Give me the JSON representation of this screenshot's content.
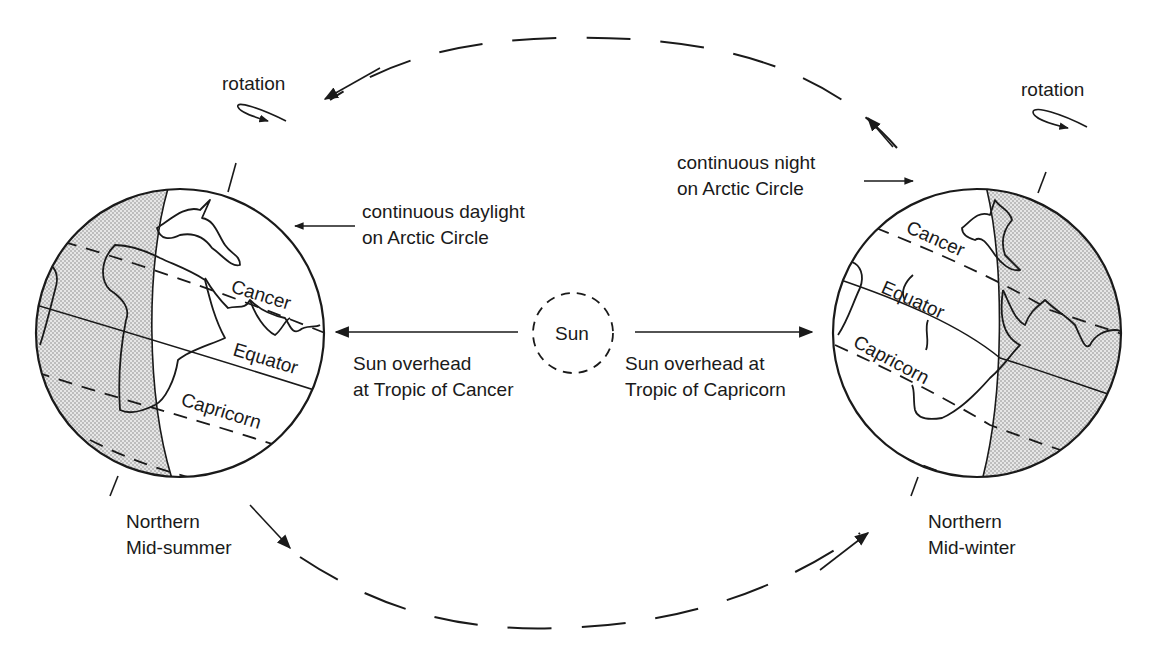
{
  "diagram": {
    "sun": {
      "label": "Sun"
    },
    "left_globe": {
      "season_line1": "Northern",
      "season_line2": "Mid-summer",
      "rotation_label": "rotation",
      "lat_labels": {
        "cancer": "Cancer",
        "equator": "Equator",
        "capricorn": "Capricorn"
      },
      "arctic_note_line1": "continuous daylight",
      "arctic_note_line2": "on Arctic Circle",
      "sun_note_line1": "Sun overhead",
      "sun_note_line2": "at Tropic of Cancer"
    },
    "right_globe": {
      "season_line1": "Northern",
      "season_line2": "Mid-winter",
      "rotation_label": "rotation",
      "lat_labels": {
        "cancer": "Cancer",
        "equator": "Equator",
        "capricorn": "Capricorn"
      },
      "arctic_note_line1": "continuous night",
      "arctic_note_line2": "on Arctic Circle",
      "sun_note_line1": "Sun overhead at",
      "sun_note_line2": "Tropic of Capricorn"
    },
    "colors": {
      "ink": "#1a1a1a",
      "shade": "#cfcfcf",
      "background": "#ffffff"
    }
  }
}
